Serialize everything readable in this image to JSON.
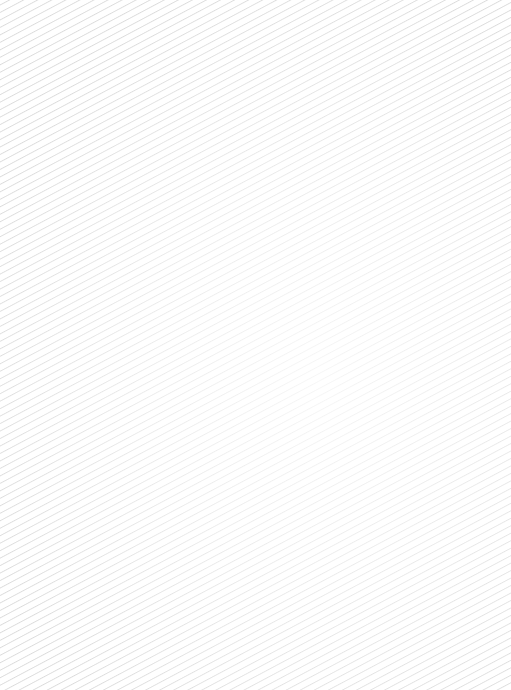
{
  "page": {
    "background_color": "#ffffff",
    "pattern": "diagonal-stripes",
    "stripe_color": "#dcdcdc"
  }
}
